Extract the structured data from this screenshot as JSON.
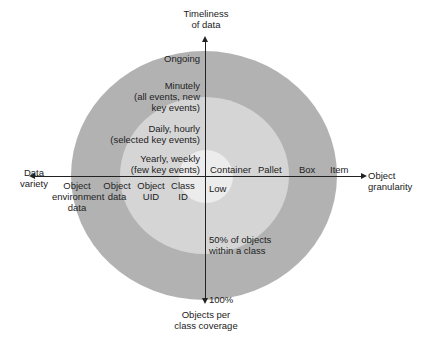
{
  "colors": {
    "outer_ring": "#b2b2b2",
    "middle_ring": "#d5d5d5",
    "inner_ring": "#ececec",
    "axis": "#222222"
  },
  "axes": {
    "top": {
      "line1": "Timeliness",
      "line2": "of data"
    },
    "bottom": {
      "line1": "Objects per",
      "line2": "class coverage"
    },
    "left": {
      "line1": "Data",
      "line2": "variety"
    },
    "right": {
      "line1": "Object",
      "line2": "granularity"
    }
  },
  "timeliness_levels": [
    {
      "line1": "Ongoing"
    },
    {
      "line1": "Minutely",
      "line2": "(all events, new",
      "line3": "key events)"
    },
    {
      "line1": "Daily, hourly",
      "line2": "(selected key events)"
    },
    {
      "line1": "Yearly, weekly",
      "line2": "(few key events)"
    }
  ],
  "variety_levels": [
    {
      "line1": "Object",
      "line2": "environment",
      "line3": "data"
    },
    {
      "line1": "Object",
      "line2": "data"
    },
    {
      "line1": "Object",
      "line2": "UID"
    },
    {
      "line1": "Class",
      "line2": "ID"
    }
  ],
  "granularity_levels": [
    "Container",
    "Pallet",
    "Box",
    "Item"
  ],
  "coverage_levels": [
    {
      "line1": "Low"
    },
    {
      "line1": "50% of objects",
      "line2": "within a class"
    },
    {
      "line1": "100%"
    }
  ]
}
